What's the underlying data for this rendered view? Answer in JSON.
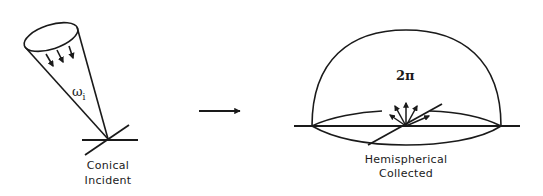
{
  "diagram": {
    "left_panel": {
      "label_line1": "Conical",
      "label_line2": "Incident",
      "solid_angle_symbol": "ω",
      "solid_angle_subscript": "i"
    },
    "transition_arrow": "right-arrow",
    "right_panel": {
      "label_line1": "Hemispherical",
      "label_line2": "Collected",
      "solid_angle_label": "2π"
    },
    "colors": {
      "stroke": "#1a1a1a",
      "background": "#ffffff"
    }
  }
}
